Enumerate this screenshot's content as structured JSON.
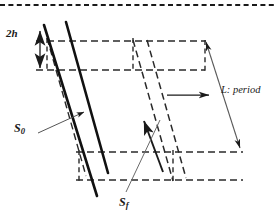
{
  "figure": {
    "type": "geometric-diagram",
    "width": 276,
    "height": 216,
    "background_color": "#ffffff",
    "line_color": "#1a1a1a",
    "thin_line_color": "#555555"
  },
  "labels": {
    "thickness": {
      "text": "2h",
      "base": "2",
      "italic_part": "h",
      "meaning": "layer thickness",
      "x": 6,
      "y": 28
    },
    "bedding_plane": {
      "base": "S",
      "subscript": "0",
      "text": "S0",
      "meaning": "bedding surface",
      "x": 14,
      "y": 122
    },
    "foliation_plane": {
      "base": "S",
      "subscript": "f",
      "text": "Sf",
      "meaning": "foliation surface",
      "x": 119,
      "y": 196
    },
    "period": {
      "text": "L: period",
      "meaning": "wavelength / period of the structure",
      "x": 221,
      "y": 85
    }
  },
  "annotations": {
    "thickness_arrow": {
      "name": "double-headed-vertical-arrow",
      "description": "double arrow measuring 2h",
      "x": 40,
      "y1": 30,
      "y2": 68
    },
    "shear_direction_arrow": {
      "name": "horizontal-shear-arrow",
      "description": "single arrow indicating shear direction",
      "x1": 167,
      "x2": 209,
      "y": 95
    },
    "period_dimension_line": {
      "name": "period-dimension-line",
      "description": "double-headed slanted line spanning one period L",
      "x1": 206,
      "y1": 42,
      "x2": 240,
      "y2": 148
    }
  },
  "geometry": {
    "top_border": {
      "name": "crop-boundary-dashed",
      "y": 5,
      "x1": 0,
      "x2": 276
    },
    "dashed_horizontals": [
      {
        "y": 41,
        "x1": 36,
        "x2": 206
      },
      {
        "y": 70,
        "x1": 36,
        "x2": 205
      },
      {
        "y": 152,
        "x1": 76,
        "x2": 243
      },
      {
        "y": 180,
        "x1": 76,
        "x2": 243
      }
    ],
    "solid_band": {
      "name": "s0-slip-band",
      "description": "thick parallel solid lines representing the S0 plane",
      "line_width": 2.4
    }
  }
}
